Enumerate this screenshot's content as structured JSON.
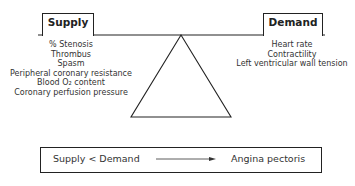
{
  "diagram": {
    "supply": {
      "label": "Supply",
      "factors": [
        "% Stenosis",
        "Thrombus",
        "Spasm",
        "Peripheral coronary resistance",
        "Blood O₂ content",
        "Coronary perfusion pressure"
      ]
    },
    "demand": {
      "label": "Demand",
      "factors": [
        "Heart rate",
        "Contractility",
        "Left ventricular wall tension"
      ]
    },
    "result": {
      "condition": "Supply < Demand",
      "outcome": "Angina pectoris"
    },
    "colors": {
      "line": "#222222",
      "text": "#333333",
      "background": "#ffffff"
    }
  }
}
